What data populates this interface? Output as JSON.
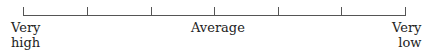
{
  "scale": {
    "tick_count": 7,
    "labels": {
      "left": [
        "Very",
        "high"
      ],
      "middle": "Average",
      "right": [
        "Very",
        "low"
      ]
    }
  }
}
